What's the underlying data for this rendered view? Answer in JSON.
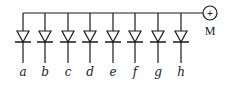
{
  "diagram": {
    "type": "diode-array",
    "bus": {
      "y": 13,
      "x_start": 23,
      "x_end": 203
    },
    "terminal": {
      "label": "M",
      "symbol": "+",
      "cx": 210,
      "cy": 13,
      "r": 7
    },
    "diodes": [
      {
        "label": "a",
        "x": 23
      },
      {
        "label": "b",
        "x": 45
      },
      {
        "label": "c",
        "x": 68
      },
      {
        "label": "d",
        "x": 90
      },
      {
        "label": "e",
        "x": 113
      },
      {
        "label": "f",
        "x": 135
      },
      {
        "label": "g",
        "x": 158
      },
      {
        "label": "h",
        "x": 181
      }
    ],
    "diode_geometry": {
      "tri_top": 31,
      "bar_y": 42,
      "lead_end": 63,
      "half_width": 6,
      "bar_half_width": 8,
      "label_y": 76
    },
    "colors": {
      "stroke": "#1a1a1a",
      "background": "#ffffff"
    }
  }
}
